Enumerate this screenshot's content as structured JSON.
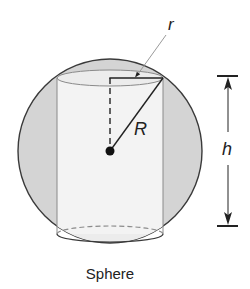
{
  "diagram": {
    "title": "Sphere",
    "labels": {
      "small_radius": "r",
      "sphere_radius": "R",
      "height": "h"
    },
    "shapes": {
      "outer": "sphere",
      "inner": "cylinder (inscribed)"
    },
    "colors": {
      "sphere_fill": "#d4d4d4",
      "cylinder_fill": "#f3f3f3",
      "outline": "#3a3a3a",
      "cylinder_edge": "#8a8a8a",
      "leader_line": "#9a9a9a"
    }
  }
}
